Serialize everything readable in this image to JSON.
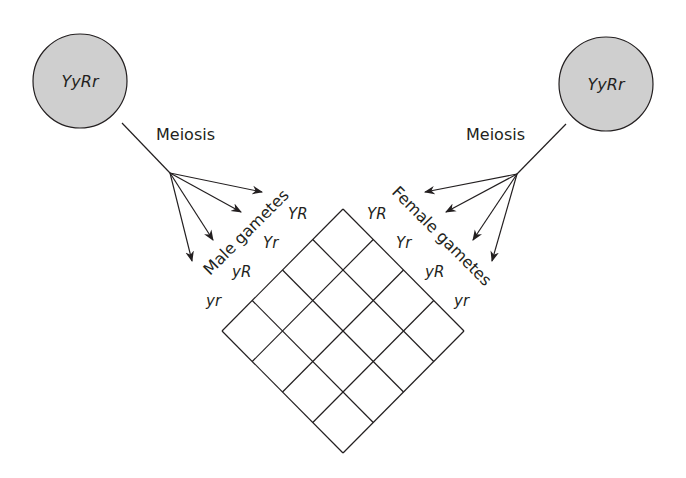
{
  "diagram": {
    "colors": {
      "circle_fill": "#cfcfcf",
      "stroke": "#231f20",
      "background": "#ffffff"
    },
    "male_parent": {
      "genotype": "YyRr",
      "process_label": "Meiosis",
      "gametes_label": "Male gametes"
    },
    "female_parent": {
      "genotype": "YyRr",
      "process_label": "Meiosis",
      "gametes_label": "Female gametes"
    },
    "male_gametes": [
      "YR",
      "Yr",
      "yR",
      "yr"
    ],
    "female_gametes": [
      "YR",
      "Yr",
      "yR",
      "yr"
    ],
    "grid": {
      "rows": 4,
      "cols": 4
    }
  }
}
